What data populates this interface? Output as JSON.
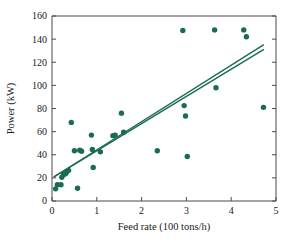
{
  "chart_data": {
    "type": "scatter",
    "title": "",
    "subtitle": "",
    "xlabel": "Feed rate (100 tons/h)",
    "ylabel": "Power (kW)",
    "xlim": [
      0,
      5
    ],
    "ylim": [
      0,
      160
    ],
    "xticks": [
      0,
      1,
      2,
      3,
      4,
      5
    ],
    "yticks": [
      0,
      20,
      40,
      60,
      80,
      100,
      120,
      140,
      160
    ],
    "xtick_labels": [
      "0",
      "1",
      "2",
      "3",
      "4",
      "5"
    ],
    "ytick_labels": [
      "0",
      "20",
      "40",
      "60",
      "80",
      "100",
      "120",
      "140",
      "160"
    ],
    "grid": false,
    "legend": null,
    "marker_color": "#1a6b4f",
    "marker_size": 4.2,
    "points": [
      {
        "x": 0.08,
        "y": 10.5
      },
      {
        "x": 0.12,
        "y": 14.0
      },
      {
        "x": 0.2,
        "y": 14.0
      },
      {
        "x": 0.22,
        "y": 20.5
      },
      {
        "x": 0.26,
        "y": 23.0
      },
      {
        "x": 0.3,
        "y": 23.5
      },
      {
        "x": 0.33,
        "y": 25.0
      },
      {
        "x": 0.37,
        "y": 26.5
      },
      {
        "x": 0.43,
        "y": 68.0
      },
      {
        "x": 0.5,
        "y": 43.5
      },
      {
        "x": 0.57,
        "y": 11.0
      },
      {
        "x": 0.62,
        "y": 44.0
      },
      {
        "x": 0.66,
        "y": 43.0
      },
      {
        "x": 0.88,
        "y": 57.0
      },
      {
        "x": 0.9,
        "y": 44.5
      },
      {
        "x": 0.92,
        "y": 29.0
      },
      {
        "x": 1.08,
        "y": 42.5
      },
      {
        "x": 1.36,
        "y": 56.5
      },
      {
        "x": 1.41,
        "y": 57.0
      },
      {
        "x": 1.55,
        "y": 76.0
      },
      {
        "x": 1.6,
        "y": 59.5
      },
      {
        "x": 2.35,
        "y": 43.5
      },
      {
        "x": 2.92,
        "y": 147.5
      },
      {
        "x": 2.95,
        "y": 82.5
      },
      {
        "x": 2.98,
        "y": 73.5
      },
      {
        "x": 3.02,
        "y": 38.5
      },
      {
        "x": 3.63,
        "y": 148.0
      },
      {
        "x": 3.66,
        "y": 98.0
      },
      {
        "x": 4.28,
        "y": 148.0
      },
      {
        "x": 4.34,
        "y": 142.0
      },
      {
        "x": 4.72,
        "y": 81.0
      }
    ],
    "fit_lines": [
      {
        "name": "least-squares-fit",
        "color": "#1a6b4f",
        "width": 1.4,
        "x0": 0.05,
        "y0": 21.0,
        "x1": 4.72,
        "y1": 135.0
      },
      {
        "name": "alternate-fit",
        "color": "#1a6b4f",
        "width": 1.4,
        "x0": 0.05,
        "y0": 21.0,
        "x1": 4.72,
        "y1": 131.0
      }
    ]
  },
  "figure": {
    "plot_area": {
      "left": 52,
      "top": 16,
      "right": 276,
      "bottom": 201
    },
    "background": "#ffffff",
    "frame_color": "#4a4a4a"
  }
}
